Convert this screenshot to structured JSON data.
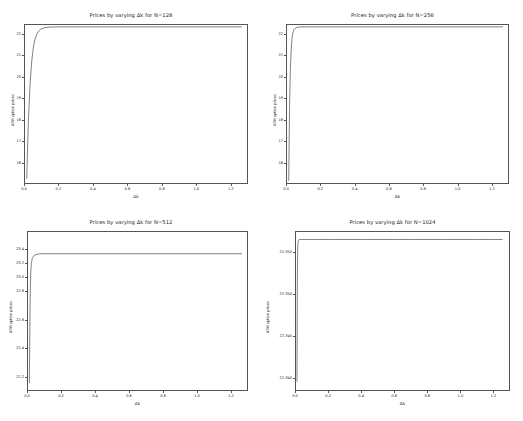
{
  "figure": {
    "background": "#ffffff",
    "line_color": "#4a4a4a",
    "axis_color": "#555555",
    "layout": "2x2 grid of line plots"
  },
  "chart_data": [
    {
      "type": "line",
      "title": "Prices by varying Δk for N=128",
      "xlabel": "Δk",
      "ylabel": "ATM option prices",
      "grid": false,
      "legend": null,
      "xlim": [
        0.0,
        1.3
      ],
      "ylim": [
        15.0,
        22.45
      ],
      "xticks": [
        "0.0",
        "0.2",
        "0.4",
        "0.6",
        "0.8",
        "1.0",
        "1.2"
      ],
      "xtickvals": [
        0.0,
        0.2,
        0.4,
        0.6,
        0.8,
        1.0,
        1.2
      ],
      "yticks": [
        "16",
        "17",
        "18",
        "19",
        "20",
        "21",
        "22"
      ],
      "ytickvals": [
        16,
        17,
        18,
        19,
        20,
        21,
        22
      ],
      "x": [
        0.01,
        0.02,
        0.03,
        0.04,
        0.05,
        0.06,
        0.07,
        0.08,
        0.09,
        0.1,
        0.12,
        0.14,
        0.16,
        0.18,
        0.2,
        0.25,
        0.3,
        0.4,
        0.5,
        0.6,
        0.7,
        0.8,
        0.9,
        1.0,
        1.1,
        1.2,
        1.27
      ],
      "y": [
        15.2,
        17.95,
        19.7,
        20.8,
        21.45,
        21.82,
        22.03,
        22.16,
        22.24,
        22.28,
        22.33,
        22.35,
        22.357,
        22.36,
        22.361,
        22.362,
        22.362,
        22.362,
        22.362,
        22.362,
        22.362,
        22.362,
        22.362,
        22.362,
        22.362,
        22.362,
        22.362
      ]
    },
    {
      "type": "line",
      "title": "Prices by varying Δk for N=256",
      "xlabel": "Δk",
      "ylabel": "ATM option prices",
      "grid": false,
      "legend": null,
      "xlim": [
        0.0,
        1.3
      ],
      "ylim": [
        15.0,
        22.45
      ],
      "xticks": [
        "0.0",
        "0.2",
        "0.4",
        "0.6",
        "0.8",
        "1.0",
        "1.2"
      ],
      "xtickvals": [
        0.0,
        0.2,
        0.4,
        0.6,
        0.8,
        1.0,
        1.2
      ],
      "yticks": [
        "16",
        "17",
        "18",
        "19",
        "20",
        "21",
        "22"
      ],
      "ytickvals": [
        16,
        17,
        18,
        19,
        20,
        21,
        22
      ],
      "x": [
        0.01,
        0.015,
        0.02,
        0.025,
        0.03,
        0.035,
        0.04,
        0.05,
        0.06,
        0.07,
        0.08,
        0.1,
        0.12,
        0.15,
        0.2,
        0.3,
        0.4,
        0.5,
        0.6,
        0.7,
        0.8,
        0.9,
        1.0,
        1.1,
        1.2,
        1.27
      ],
      "y": [
        15.1,
        18.6,
        20.4,
        21.35,
        21.85,
        22.1,
        22.22,
        22.31,
        22.345,
        22.355,
        22.359,
        22.361,
        22.362,
        22.362,
        22.362,
        22.362,
        22.362,
        22.362,
        22.362,
        22.362,
        22.362,
        22.362,
        22.362,
        22.362,
        22.362,
        22.362
      ]
    },
    {
      "type": "line",
      "title": "Prices by varying Δk for N=512",
      "xlabel": "Δk",
      "ylabel": "ATM option prices",
      "grid": false,
      "legend": null,
      "xlim": [
        0.0,
        1.3
      ],
      "ylim": [
        22.18,
        22.405
      ],
      "xticks": [
        "0.0",
        "0.2",
        "0.4",
        "0.6",
        "0.8",
        "1.0",
        "1.2"
      ],
      "xtickvals": [
        0.0,
        0.2,
        0.4,
        0.6,
        0.8,
        1.0,
        1.2
      ],
      "yticks": [
        "22.2",
        "22.4",
        "22.6",
        "22.8",
        "23.0",
        "23.2",
        "23.4"
      ],
      "ytickvals": [
        22.2,
        22.24,
        22.28,
        22.32,
        22.34,
        22.36,
        22.38
      ],
      "x": [
        0.008,
        0.01,
        0.012,
        0.014,
        0.016,
        0.018,
        0.02,
        0.025,
        0.03,
        0.04,
        0.05,
        0.07,
        0.1,
        0.15,
        0.2,
        0.3,
        0.4,
        0.5,
        0.6,
        0.7,
        0.8,
        0.9,
        1.0,
        1.1,
        1.2,
        1.27
      ],
      "y": [
        22.19,
        22.245,
        22.295,
        22.325,
        22.345,
        22.355,
        22.36,
        22.367,
        22.37,
        22.372,
        22.373,
        22.374,
        22.374,
        22.374,
        22.374,
        22.374,
        22.374,
        22.374,
        22.374,
        22.374,
        22.374,
        22.374,
        22.374,
        22.374,
        22.374,
        22.374
      ]
    },
    {
      "type": "line",
      "title": "Prices by varying Δk for N=1024",
      "xlabel": "Δk",
      "ylabel": "ATM option prices",
      "grid": false,
      "legend": null,
      "xlim": [
        0.0,
        1.3
      ],
      "ylim": [
        22.3385,
        22.3575
      ],
      "xticks": [
        "0.0",
        "0.2",
        "0.4",
        "0.6",
        "0.8",
        "1.0",
        "1.2"
      ],
      "xtickvals": [
        0.0,
        0.2,
        0.4,
        0.6,
        0.8,
        1.0,
        1.2
      ],
      "yticks": [
        "22.355",
        "22.350",
        "22.355",
        "22.350",
        "22.345",
        "22.340",
        "22.345",
        "22.340"
      ],
      "ytick_labels": [
        "22.340",
        "22.345",
        "22.350",
        "22.355"
      ],
      "ytickvals": [
        22.34,
        22.345,
        22.35,
        22.355
      ],
      "x": [
        0.006,
        0.007,
        0.008,
        0.009,
        0.01,
        0.012,
        0.015,
        0.02,
        0.03,
        0.05,
        0.08,
        0.12,
        0.2,
        0.3,
        0.4,
        0.5,
        0.6,
        0.7,
        0.8,
        0.9,
        1.0,
        1.1,
        1.2,
        1.26
      ],
      "y": [
        22.3395,
        22.3455,
        22.3505,
        22.3535,
        22.3552,
        22.3562,
        22.3565,
        22.3566,
        22.3566,
        22.3566,
        22.3566,
        22.3566,
        22.3566,
        22.3566,
        22.3566,
        22.3566,
        22.3566,
        22.3566,
        22.3566,
        22.3566,
        22.3566,
        22.3566,
        22.3566,
        22.3566
      ]
    }
  ]
}
